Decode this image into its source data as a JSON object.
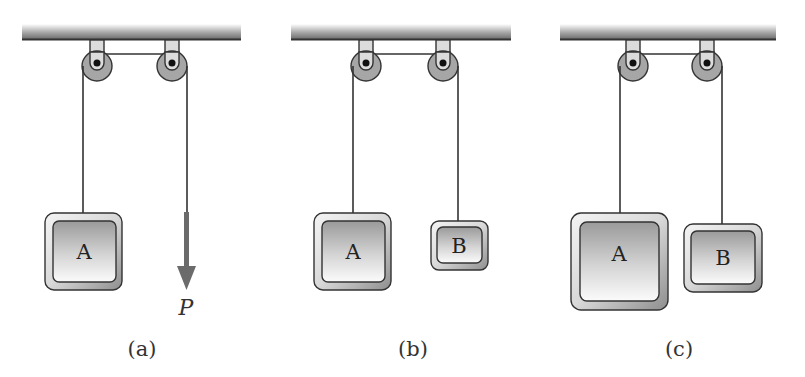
{
  "figure": {
    "panels": [
      {
        "id": "a",
        "caption": "(a)",
        "ceiling": {
          "x1": 22,
          "x2": 241
        },
        "pulleys": [
          {
            "cx": 97,
            "cy": 63
          },
          {
            "cx": 172,
            "cy": 63
          }
        ],
        "blocks": [
          {
            "label": "A",
            "x": 45,
            "y": 213,
            "w": 77,
            "h": 77,
            "rope_x": 83
          }
        ],
        "force": {
          "label": "P",
          "x": 186,
          "y1": 212,
          "y2": 290
        }
      },
      {
        "id": "b",
        "caption": "(b)",
        "ceiling": {
          "x1": 291,
          "x2": 511
        },
        "pulleys": [
          {
            "cx": 366,
            "cy": 63
          },
          {
            "cx": 443,
            "cy": 63
          }
        ],
        "blocks": [
          {
            "label": "A",
            "x": 314,
            "y": 213,
            "w": 77,
            "h": 77,
            "rope_x": 353
          },
          {
            "label": "B",
            "x": 431,
            "y": 221,
            "w": 57,
            "h": 49,
            "rope_x": 458
          }
        ]
      },
      {
        "id": "c",
        "caption": "(c)",
        "ceiling": {
          "x1": 560,
          "x2": 776
        },
        "pulleys": [
          {
            "cx": 633,
            "cy": 63
          },
          {
            "cx": 707,
            "cy": 63
          }
        ],
        "blocks": [
          {
            "label": "A",
            "x": 571,
            "y": 213,
            "w": 97,
            "h": 97,
            "rope_x": 621
          },
          {
            "label": "B",
            "x": 684,
            "y": 224,
            "w": 78,
            "h": 68,
            "rope_x": 722
          }
        ]
      }
    ],
    "colors": {
      "ceiling_dark": "#555555",
      "pulley_fill": "#a6a6a6",
      "bracket_fill": "#dcdcdc",
      "rope": "#333333",
      "force_arrow": "#6b6b6b"
    }
  }
}
